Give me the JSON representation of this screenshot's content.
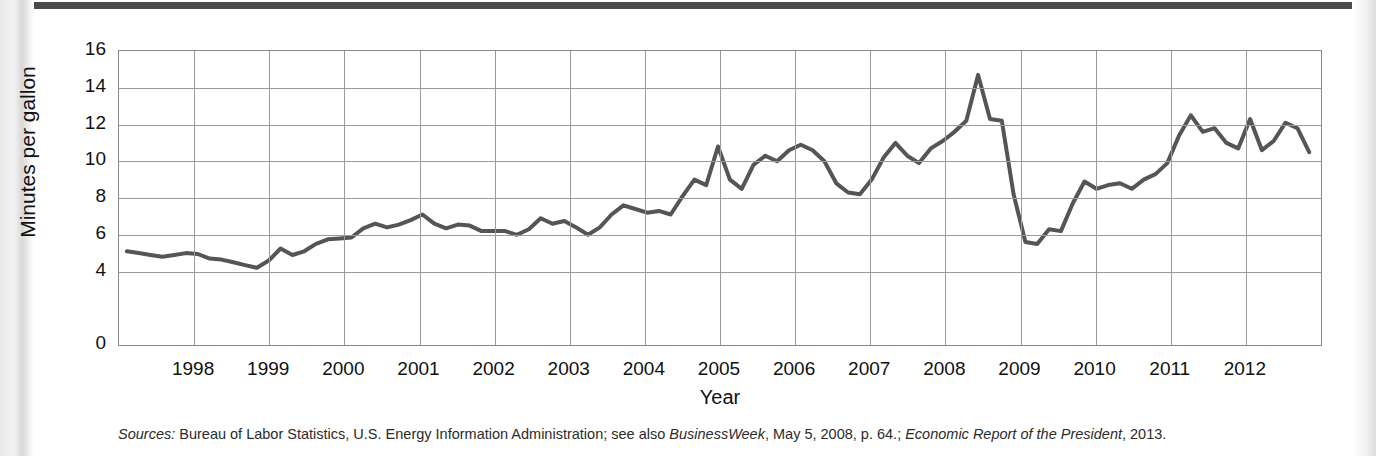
{
  "figure": {
    "sources_prefix": "Sources:",
    "sources_part1": " Bureau of Labor Statistics, U.S. Energy Information Administration; see also ",
    "sources_italic1": "BusinessWeek",
    "sources_part2": ", May 5, 2008, p. 64.; ",
    "sources_italic2": "Economic Report of the President",
    "sources_part3": ", 2013."
  },
  "chart_data": {
    "type": "line",
    "title": "",
    "xlabel": "Year",
    "ylabel": "Minutes per gallon",
    "ylim": [
      0,
      16
    ],
    "yticks": [
      0,
      4,
      6,
      8,
      10,
      12,
      14,
      16
    ],
    "ytick_labels": [
      "0",
      "4",
      "6",
      "8",
      "10",
      "12",
      "14",
      "16"
    ],
    "ygrid_values": [
      4,
      6,
      8,
      10,
      12,
      14,
      16
    ],
    "xlim": [
      1997.5,
      2012.75
    ],
    "categories": [
      "1998",
      "1999",
      "2000",
      "2001",
      "2002",
      "2003",
      "2004",
      "2005",
      "2006",
      "2007",
      "2008",
      "2009",
      "2010",
      "2011",
      "2012"
    ],
    "xtick_labels": [
      "1998",
      "1999",
      "2000",
      "2001",
      "2002",
      "2003",
      "2004",
      "2005",
      "2006",
      "2007",
      "2008",
      "2009",
      "2010",
      "2011",
      "2012"
    ],
    "grid": true,
    "legend": "none",
    "line_color": "#555555",
    "line_width": 4,
    "series": [
      {
        "name": "Minutes per gallon",
        "x": [
          1997.6,
          1997.75,
          1997.9,
          1998.05,
          1998.2,
          1998.35,
          1998.5,
          1998.65,
          1998.8,
          1998.95,
          1999.1,
          1999.25,
          1999.4,
          1999.55,
          1999.7,
          1999.85,
          2000.0,
          2000.15,
          2000.3,
          2000.45,
          2000.6,
          2000.75,
          2000.9,
          2001.05,
          2001.2,
          2001.35,
          2001.5,
          2001.65,
          2001.8,
          2001.95,
          2002.1,
          2002.25,
          2002.4,
          2002.55,
          2002.7,
          2002.85,
          2003.0,
          2003.15,
          2003.3,
          2003.45,
          2003.6,
          2003.75,
          2003.9,
          2004.05,
          2004.2,
          2004.35,
          2004.5,
          2004.65,
          2004.8,
          2004.95,
          2005.1,
          2005.25,
          2005.4,
          2005.55,
          2005.7,
          2005.85,
          2006.0,
          2006.15,
          2006.3,
          2006.45,
          2006.6,
          2006.75,
          2006.9,
          2007.05,
          2007.2,
          2007.35,
          2007.5,
          2007.65,
          2007.8,
          2007.95,
          2008.1,
          2008.25,
          2008.4,
          2008.55,
          2008.7,
          2008.85,
          2009.0,
          2009.15,
          2009.3,
          2009.45,
          2009.6,
          2009.75,
          2009.9,
          2010.05,
          2010.2,
          2010.35,
          2010.5,
          2010.65,
          2010.8,
          2010.95,
          2011.1,
          2011.25,
          2011.4,
          2011.55,
          2011.7,
          2011.85,
          2012.0,
          2012.15,
          2012.3,
          2012.45,
          2012.6
        ],
        "values": [
          5.1,
          5.0,
          4.9,
          4.8,
          4.9,
          5.0,
          4.95,
          4.7,
          4.65,
          4.5,
          4.35,
          4.2,
          4.6,
          5.25,
          4.9,
          5.1,
          5.5,
          5.75,
          5.8,
          5.85,
          6.35,
          6.6,
          6.4,
          6.55,
          6.8,
          7.1,
          6.6,
          6.35,
          6.55,
          6.5,
          6.2,
          6.2,
          6.2,
          6.0,
          6.3,
          6.9,
          6.6,
          6.75,
          6.4,
          6.0,
          6.4,
          7.1,
          7.6,
          7.4,
          7.2,
          7.3,
          7.1,
          8.1,
          9.0,
          8.7,
          10.8,
          9.0,
          8.5,
          9.8,
          10.3,
          10.0,
          10.6,
          10.9,
          10.6,
          10.0,
          8.8,
          8.3,
          8.2,
          9.0,
          10.2,
          11.0,
          10.3,
          9.9,
          10.7,
          11.1,
          11.6,
          12.2,
          14.7,
          12.3,
          12.2,
          8.2,
          5.6,
          5.5,
          6.3,
          6.2,
          7.7,
          8.9,
          8.5,
          8.7,
          8.8,
          8.5,
          9.0,
          9.3,
          9.9,
          11.4,
          12.5,
          11.6,
          11.8,
          11.0,
          10.7,
          12.3,
          10.6,
          11.1,
          12.1,
          11.8,
          10.5
        ]
      }
    ]
  }
}
